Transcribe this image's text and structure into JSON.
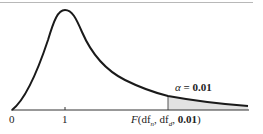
{
  "figure": {
    "type": "F-distribution density curve",
    "x_tick_labels": [
      "0",
      "1"
    ],
    "critical_label": {
      "func": "F",
      "open": "(df",
      "sub_n": "n",
      "sep": ", df",
      "sub_d": "d",
      "sep2": ", ",
      "alpha_value": "0.01",
      "close": ")"
    },
    "alpha_label": {
      "symbol": "α",
      "eq": " = ",
      "value": "0.01"
    },
    "colors": {
      "curve": "#1a1a1a",
      "axis": "#333333",
      "shade": "#e2e2e2"
    }
  }
}
